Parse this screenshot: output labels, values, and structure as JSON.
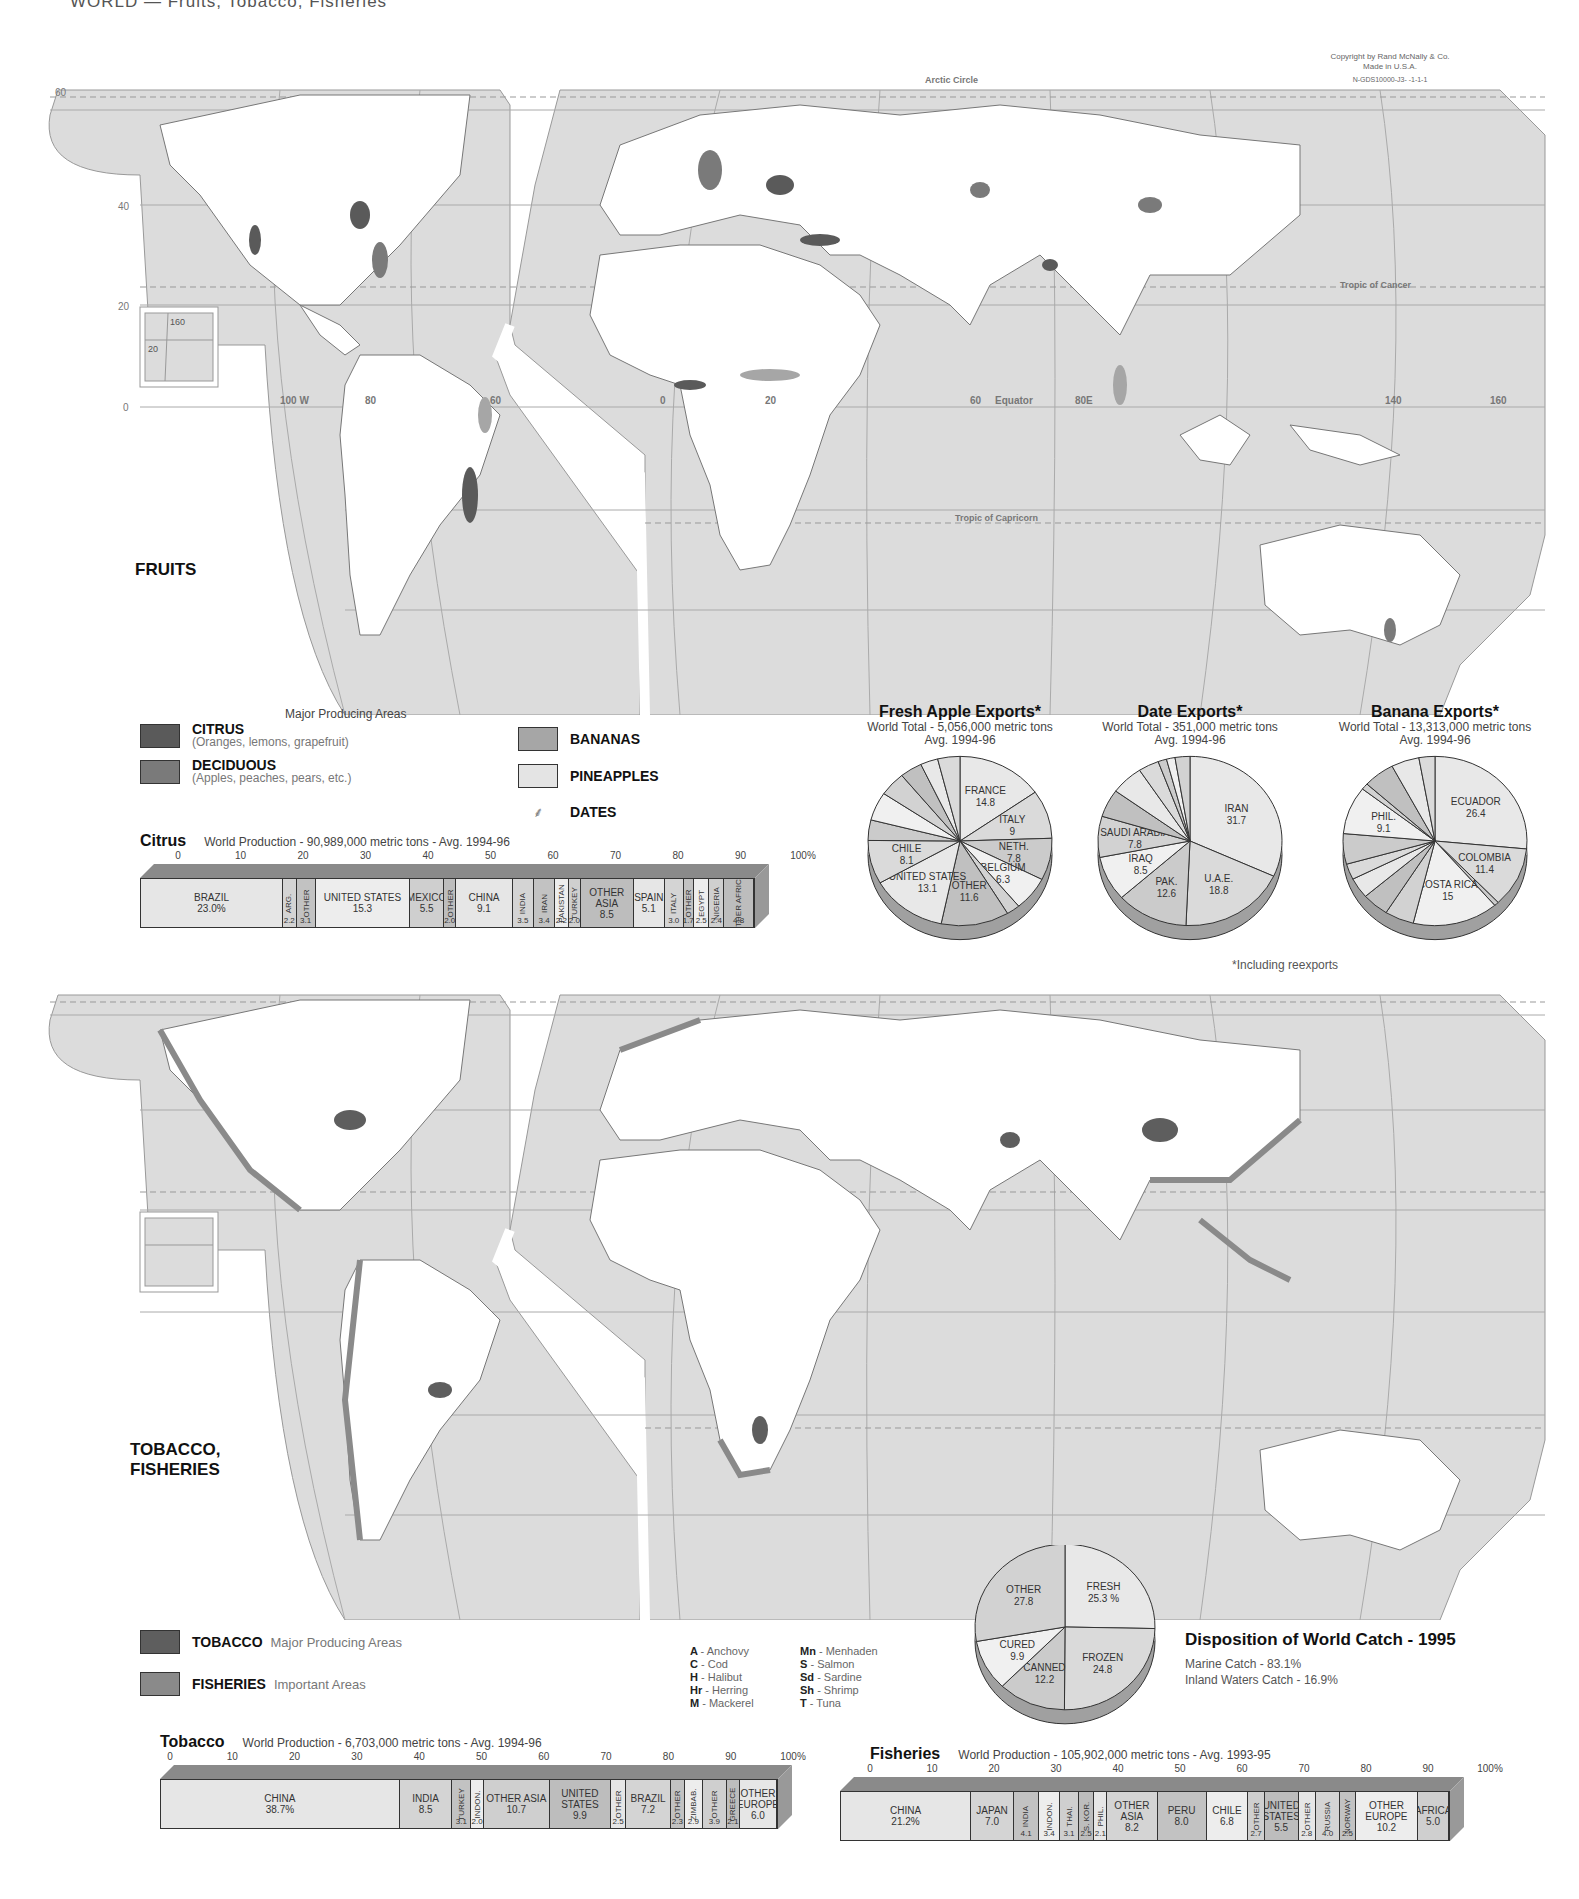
{
  "page": {
    "header": "WORLD — Fruits, Tobacco, Fisheries",
    "copyright": [
      "Copyright by Rand McNally & Co.",
      "Made in U.S.A.",
      "N-GDS10000-J3- -1-1-1"
    ]
  },
  "fruits_map": {
    "title": "FRUITS",
    "caption": "Major Producing Areas",
    "labels": {
      "arctic_circle": "Arctic Circle",
      "tropic_cancer": "Tropic of Cancer",
      "tropic_capricorn": "Tropic of Capricorn",
      "equator": "Equator",
      "lon_100w": "100 W",
      "lon_80": "80",
      "lon_60": "60",
      "lon_0": "0",
      "lon_20": "20",
      "lon_60e": "60",
      "lon_80e": "80E",
      "lon_140": "140",
      "lon_160": "160",
      "lat_60": "60",
      "lat_40": "40",
      "lat_20": "20",
      "lat_0": "0",
      "inset_160": "160",
      "inset_20": "20"
    },
    "legend": [
      {
        "key": "citrus",
        "title": "CITRUS",
        "sub": "(Oranges, lemons, grapefruit)",
        "color": "#5a5a5a"
      },
      {
        "key": "deciduous",
        "title": "DECIDUOUS",
        "sub": "(Apples, peaches, pears, etc.)",
        "color": "#7a7a7a"
      },
      {
        "key": "bananas",
        "title": "BANANAS",
        "sub": "",
        "color": "#a6a6a6"
      },
      {
        "key": "pineapples",
        "title": "PINEAPPLES",
        "sub": "",
        "color": "#e4e4e4"
      },
      {
        "key": "dates",
        "title": "DATES",
        "sub": "",
        "icon": "palm-tree"
      }
    ]
  },
  "fisheries_map": {
    "title_line1": "TOBACCO,",
    "title_line2": "FISHERIES",
    "legend": [
      {
        "key": "tobacco",
        "title": "TOBACCO",
        "sub": "Major Producing Areas",
        "color": "#5e5e5e"
      },
      {
        "key": "fisheries",
        "title": "FISHERIES",
        "sub": "Important Areas",
        "color": "#8a8a8a"
      }
    ],
    "fish_codes": [
      {
        "code": "A",
        "name": "- Anchovy"
      },
      {
        "code": "Mn",
        "name": "- Menhaden"
      },
      {
        "code": "C",
        "name": "- Cod"
      },
      {
        "code": "S",
        "name": "- Salmon"
      },
      {
        "code": "H",
        "name": "- Halibut"
      },
      {
        "code": "Sd",
        "name": "- Sardine"
      },
      {
        "code": "Hr",
        "name": "- Herring"
      },
      {
        "code": "Sh",
        "name": "- Shrimp"
      },
      {
        "code": "M",
        "name": "- Mackerel"
      },
      {
        "code": "T",
        "name": "- Tuna"
      }
    ]
  },
  "footnote": "*Including reexports",
  "catch": {
    "title": "Disposition of World Catch - 1995",
    "marine": "Marine Catch - 83.1%",
    "inland": "Inland Waters Catch - 16.9%"
  },
  "chart_data": [
    {
      "type": "bar",
      "id": "citrus",
      "title": "Citrus",
      "subtitle": "World Production - 90,989,000 metric tons - Avg. 1994-96",
      "axis_ticks": [
        "0",
        "10",
        "20",
        "30",
        "40",
        "50",
        "60",
        "70",
        "80",
        "90",
        "100%"
      ],
      "categories": [
        "BRAZIL",
        "ARG.",
        "OTHER",
        "UNITED STATES",
        "MEXICO",
        "OTHER",
        "CHINA",
        "INDIA",
        "IRAN",
        "PAKISTAN",
        "TURKEY",
        "OTHER ASIA",
        "SPAIN",
        "ITALY",
        "OTHER",
        "EGYPT",
        "NIGERIA",
        "OTHER AFRICA"
      ],
      "values": [
        23.0,
        2.2,
        3.1,
        15.3,
        5.5,
        2.0,
        9.1,
        3.5,
        3.4,
        2.2,
        2.0,
        8.5,
        5.1,
        3.0,
        1.7,
        2.5,
        2.4,
        4.8
      ],
      "labels": [
        "23.0%",
        "2.2",
        "3.1",
        "15.3",
        "5.5",
        "2.0",
        "9.1",
        "3.5",
        "3.4",
        "2.2",
        "2.0",
        "8.5",
        "5.1",
        "3.0",
        "1.7",
        "2.5",
        "2.4",
        "4.8"
      ]
    },
    {
      "type": "pie",
      "id": "apple",
      "title": "Fresh Apple Exports*",
      "subtitle": "World Total - 5,056,000 metric tons",
      "period": "Avg. 1994-96",
      "categories": [
        "FRANCE",
        "ITALY",
        "NETH.",
        "BELGIUM",
        "POLAND",
        "OTHER",
        "UNITED STATES",
        "CHILE",
        "ARG.",
        "NEW ZEALAND",
        "S. AFRICA",
        "IRAN",
        "CHINA",
        "OTHER"
      ],
      "values": [
        14.8,
        9.0,
        7.8,
        6.3,
        2.3,
        11.6,
        13.1,
        8.1,
        3.8,
        5.3,
        4.5,
        3.8,
        3.0,
        3.8
      ]
    },
    {
      "type": "pie",
      "id": "date",
      "title": "Date Exports*",
      "subtitle": "World Total - 351,000 metric tons",
      "period": "Avg. 1994-96",
      "categories": [
        "IRAN",
        "U.A.E.",
        "PAK.",
        "IRAQ",
        "SAUDI ARABIA",
        "OTHER",
        "TUNISIA",
        "ALGERIA",
        "",
        "",
        "EUROPE"
      ],
      "values": [
        31.7,
        18.8,
        12.6,
        8.5,
        7.8,
        5.3,
        5.7,
        3.6,
        1.5,
        1.5,
        2.6
      ]
    },
    {
      "type": "pie",
      "id": "banana",
      "title": "Banana Exports*",
      "subtitle": "World Total - 13,313,000 metric tons",
      "period": "Avg. 1994-96",
      "categories": [
        "ECUADOR",
        "COLOMBIA",
        "",
        "COSTA RICA",
        "PANAMA",
        "GUAT.",
        "HOND.",
        "USA",
        "OTHER",
        "PHIL.",
        "",
        "BELGIUM",
        "OTHER",
        "AFRICA"
      ],
      "values": [
        26.4,
        11.4,
        0.8,
        15.0,
        5.1,
        4.7,
        3.9,
        3.0,
        5.8,
        9.1,
        1.2,
        5.5,
        4.9,
        2.8
      ]
    },
    {
      "type": "pie",
      "id": "catch",
      "title": "Disposition of World Catch - 1995",
      "categories": [
        "FRESH",
        "FROZEN",
        "CANNED",
        "CURED",
        "OTHER"
      ],
      "values": [
        25.3,
        24.8,
        12.2,
        9.9,
        27.8
      ],
      "labels": [
        "25.3 %",
        "24.8",
        "12.2",
        "9.9",
        "27.8"
      ]
    },
    {
      "type": "bar",
      "id": "tobacco",
      "title": "Tobacco",
      "subtitle": "World Production - 6,703,000 metric tons - Avg. 1994-96",
      "axis_ticks": [
        "0",
        "10",
        "20",
        "30",
        "40",
        "50",
        "60",
        "70",
        "80",
        "90",
        "100%"
      ],
      "categories": [
        "CHINA",
        "INDIA",
        "TURKEY",
        "INDON.",
        "OTHER ASIA",
        "UNITED STATES",
        "OTHER",
        "BRAZIL",
        "OTHER",
        "ZIMBAB.",
        "OTHER",
        "GREECE",
        "OTHER EUROPE"
      ],
      "values": [
        38.7,
        8.5,
        3.1,
        2.0,
        10.7,
        9.9,
        2.5,
        7.2,
        2.3,
        2.9,
        3.9,
        2.1,
        6.0
      ],
      "labels": [
        "38.7%",
        "8.5",
        "3.1",
        "2.0",
        "10.7",
        "9.9",
        "2.5",
        "7.2",
        "2.3",
        "2.9",
        "3.9",
        "2.1",
        "6.0"
      ]
    },
    {
      "type": "bar",
      "id": "fisheries",
      "title": "Fisheries",
      "subtitle": "World Production - 105,902,000 metric tons - Avg. 1993-95",
      "axis_ticks": [
        "0",
        "10",
        "20",
        "30",
        "40",
        "50",
        "60",
        "70",
        "80",
        "90",
        "100%"
      ],
      "categories": [
        "CHINA",
        "JAPAN",
        "INDIA",
        "INDON.",
        "THAI.",
        "S. KOR.",
        "PHIL.",
        "OTHER ASIA",
        "PERU",
        "CHILE",
        "OTHER",
        "UNITED STATES",
        "OTHER",
        "RUSSIA",
        "NORWAY",
        "OTHER EUROPE",
        "AFRICA"
      ],
      "values": [
        21.2,
        7.0,
        4.1,
        3.4,
        3.1,
        2.5,
        2.1,
        8.2,
        8.0,
        6.8,
        2.7,
        5.5,
        2.8,
        4.0,
        2.5,
        10.2,
        5.0
      ],
      "labels": [
        "21.2%",
        "7.0",
        "4.1",
        "3.4",
        "3.1",
        "2.5",
        "2.1",
        "8.2",
        "8.0",
        "6.8",
        "2.7",
        "5.5",
        "2.8",
        "4.0",
        "2.5",
        "10.2",
        "5.0"
      ]
    }
  ]
}
